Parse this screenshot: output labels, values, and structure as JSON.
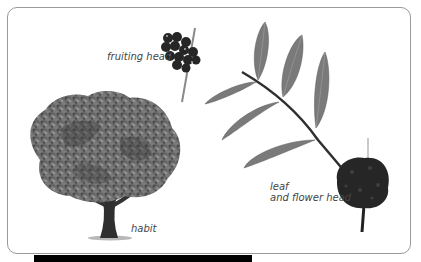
{
  "figure": {
    "labels": {
      "fruiting_head": "fruiting head",
      "leaf_line1": "leaf",
      "leaf_line2": "and flower head",
      "habit": "habit"
    },
    "illustrations": [
      "tree-habit",
      "fruiting-head",
      "pinnate-leaf",
      "flower-head"
    ],
    "colors": {
      "frame_border": "#9a9a9a",
      "foliage": "#5a5a5a",
      "leaf": "#7a7a7a",
      "dark_fruit": "#262626",
      "bottom_bar": "#000000"
    }
  }
}
